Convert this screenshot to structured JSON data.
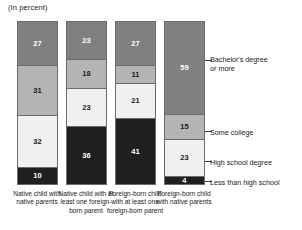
{
  "chart_title": "(In percent)",
  "chart_data": {
    "type": "bar",
    "subtype": "stacked-100-percent",
    "title": "(In percent)",
    "xlabel": "",
    "ylabel": "",
    "ylim": [
      0,
      100
    ],
    "grid": false,
    "legend_position": "right-axis-callouts",
    "categories": [
      "Native child with native parents",
      "Native child with at least one foreign-born parent",
      "Foreign-born child with at least one foreign-born parent",
      "Foreign-born child with native parents"
    ],
    "series": [
      {
        "name": "Bachelor's degree or more",
        "color": "#808080",
        "label_color": "#ffffff",
        "values": [
          27,
          23,
          27,
          59
        ]
      },
      {
        "name": "Some college",
        "color": "#b4b4b4",
        "label_color": "#1a1a1a",
        "values": [
          31,
          18,
          11,
          15
        ]
      },
      {
        "name": "High school degree",
        "color": "#f0f0ee",
        "label_color": "#1a1a1a",
        "values": [
          32,
          23,
          21,
          23
        ]
      },
      {
        "name": "Less than high school",
        "color": "#1f1f1f",
        "label_color": "#ffffff",
        "values": [
          10,
          36,
          41,
          4
        ]
      }
    ]
  },
  "x_axis_labels": [
    "Native child with native parents",
    "Native child with at least one foreign-born parent",
    "Foreign-born child with at least one foreign-born parent",
    "Foreign-born child with native parents"
  ],
  "legend": {
    "entries": [
      {
        "label": "Bachelor's degree or more",
        "top": 55
      },
      {
        "label": "Some college",
        "top": 128
      },
      {
        "label": "High school degree",
        "top": 158
      },
      {
        "label": "Less than high school",
        "top": 178
      }
    ],
    "ticks": [
      {
        "top": 60
      },
      {
        "top": 131
      },
      {
        "top": 161
      },
      {
        "top": 181
      }
    ]
  }
}
